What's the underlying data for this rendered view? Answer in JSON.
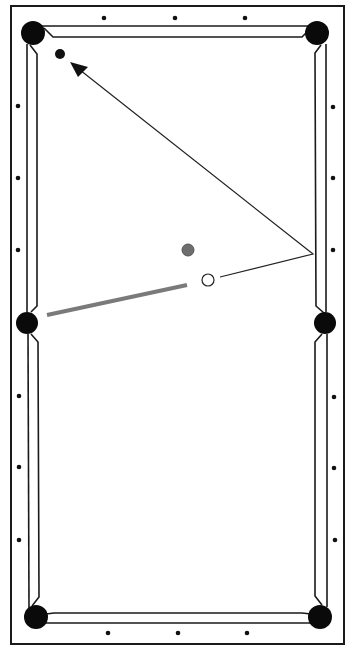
{
  "diagram": {
    "type": "billiards-shot-diagram",
    "colors": {
      "background": "#ffffff",
      "line": "#1a1a1a",
      "pocket": "#0a0a0a",
      "diamond": "#111111",
      "object_ball": "#111111",
      "target_ball": "#6e6e6e",
      "cue_ball_fill": "#ffffff",
      "cue_stick": "#7a7a7a",
      "aim_line": "#222222"
    },
    "table": {
      "outer": {
        "x": 11,
        "y": 6,
        "w": 333,
        "h": 638
      },
      "pockets": [
        {
          "name": "top-left",
          "cx": 33,
          "cy": 33,
          "r": 12
        },
        {
          "name": "top-right",
          "cx": 317,
          "cy": 33,
          "r": 12
        },
        {
          "name": "side-left",
          "cx": 27,
          "cy": 323,
          "r": 11
        },
        {
          "name": "side-right",
          "cx": 325,
          "cy": 323,
          "r": 11
        },
        {
          "name": "bottom-left",
          "cx": 36,
          "cy": 617,
          "r": 12
        },
        {
          "name": "bottom-right",
          "cx": 320,
          "cy": 617,
          "r": 12
        }
      ],
      "diamonds": {
        "top": [
          [
            104,
            18
          ],
          [
            175,
            18
          ],
          [
            245,
            18
          ]
        ],
        "bottom": [
          [
            108,
            633
          ],
          [
            178,
            633
          ],
          [
            247,
            633
          ]
        ],
        "left": [
          [
            18,
            106
          ],
          [
            18,
            178
          ],
          [
            18,
            250
          ],
          [
            19,
            396
          ],
          [
            19,
            467
          ],
          [
            19,
            540
          ]
        ],
        "right": [
          [
            333,
            107
          ],
          [
            333,
            178
          ],
          [
            333,
            250
          ],
          [
            334,
            397
          ],
          [
            334,
            468
          ],
          [
            335,
            540
          ]
        ]
      }
    },
    "balls": {
      "object_ball": {
        "cx": 60,
        "cy": 54,
        "r": 5
      },
      "target_ball": {
        "cx": 188,
        "cy": 250,
        "r": 6
      },
      "cue_ball": {
        "cx": 208,
        "cy": 280,
        "r": 6
      }
    },
    "cue_stick": {
      "x1": 47,
      "y1": 315,
      "x2": 187,
      "y2": 285,
      "width": 4
    },
    "aim_path": {
      "points": [
        [
          220,
          277
        ],
        [
          313,
          254
        ],
        [
          80,
          70
        ]
      ],
      "arrow_tip": [
        70,
        62
      ]
    }
  }
}
